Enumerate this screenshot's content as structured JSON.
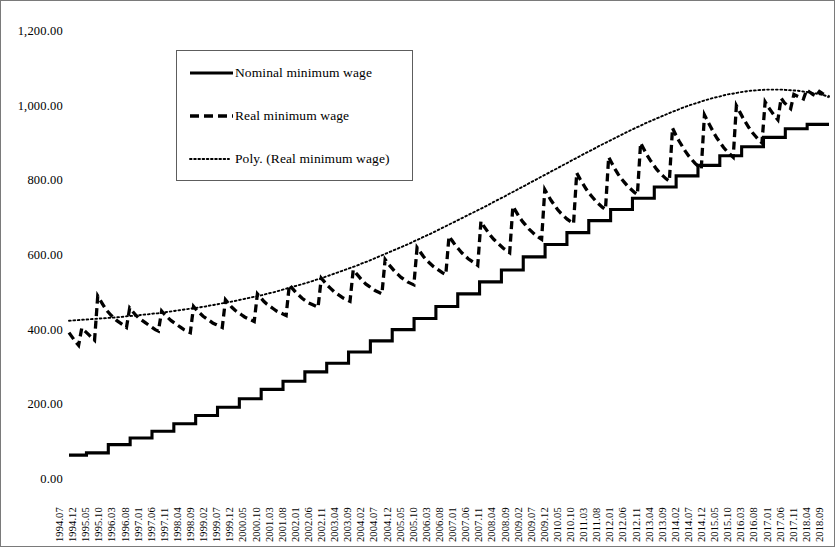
{
  "chart_data": {
    "type": "line",
    "title": "",
    "subtitle": "",
    "xlabel": "",
    "ylabel": "",
    "ylim": [
      0,
      1200
    ],
    "ytick_step": 200,
    "grid": false,
    "legend_position": "upper-left-inset",
    "y_ticks": [
      "0.00",
      "200.00",
      "400.00",
      "600.00",
      "800.00",
      "1,000.00",
      "1,200.00"
    ],
    "x_tick_labels": [
      "1994.07",
      "1994.12",
      "1995.05",
      "1995.10",
      "1996.03",
      "1996.08",
      "1997.01",
      "1997.06",
      "1997.11",
      "1998.04",
      "1998.09",
      "1999.02",
      "1999.07",
      "1999.12",
      "2000.05",
      "2000.10",
      "2001.03",
      "2001.08",
      "2002.01",
      "2002.06",
      "2002.11",
      "2003.04",
      "2003.09",
      "2004.02",
      "2004.07",
      "2004.12",
      "2005.05",
      "2005.10",
      "2006.03",
      "2006.08",
      "2007.01",
      "2007.06",
      "2007.11",
      "2008.04",
      "2008.09",
      "2009.02",
      "2009.07",
      "2009.12",
      "2010.05",
      "2010.10",
      "2011.03",
      "2011.08",
      "2012.01",
      "2012.06",
      "2012.11",
      "2013.04",
      "2013.09",
      "2014.02",
      "2014.07",
      "2014.12",
      "2015.05",
      "2015.10",
      "2016.03",
      "2016.08",
      "2017.01",
      "2017.06",
      "2017.11",
      "2018.04",
      "2018.09"
    ],
    "series": [
      {
        "name": "Nominal minimum wage",
        "style": "solid",
        "color": "#000000",
        "shape": "step",
        "values": [
          64,
          64,
          64,
          64,
          70,
          70,
          70,
          70,
          70,
          92,
          92,
          92,
          92,
          92,
          110,
          110,
          110,
          110,
          110,
          128,
          128,
          128,
          128,
          128,
          148,
          148,
          148,
          148,
          148,
          170,
          170,
          170,
          170,
          170,
          192,
          192,
          192,
          192,
          192,
          215,
          215,
          215,
          215,
          215,
          240,
          240,
          240,
          240,
          240,
          262,
          262,
          262,
          262,
          262,
          287,
          287,
          287,
          287,
          287,
          310,
          310,
          310,
          310,
          310,
          340,
          340,
          340,
          340,
          340,
          370,
          370,
          370,
          370,
          370,
          400,
          400,
          400,
          400,
          400,
          430,
          430,
          430,
          430,
          430,
          462,
          462,
          462,
          462,
          462,
          496,
          496,
          496,
          496,
          496,
          528,
          528,
          528,
          528,
          528,
          560,
          560,
          560,
          560,
          560,
          595,
          595,
          595,
          595,
          595,
          628,
          628,
          628,
          628,
          628,
          660,
          660,
          660,
          660,
          660,
          692,
          692,
          692,
          692,
          692,
          722,
          722,
          722,
          722,
          722,
          752,
          752,
          752,
          752,
          752,
          782,
          782,
          782,
          782,
          782,
          812,
          812,
          812,
          812,
          812,
          840,
          840,
          840,
          840,
          840,
          866,
          866,
          866,
          866,
          866,
          890,
          890,
          890,
          890,
          890,
          915,
          915,
          915,
          915,
          915,
          938,
          938,
          938,
          938,
          938,
          950,
          950,
          950,
          950,
          950,
          950
        ]
      },
      {
        "name": "Real minimum wage",
        "style": "dashed",
        "color": "#000000",
        "shape": "sawtooth",
        "values": [
          392,
          380,
          368,
          358,
          404,
          396,
          388,
          380,
          372,
          490,
          476,
          462,
          450,
          440,
          432,
          424,
          418,
          412,
          406,
          458,
          448,
          438,
          430,
          424,
          418,
          412,
          406,
          400,
          396,
          450,
          440,
          432,
          424,
          418,
          412,
          406,
          400,
          396,
          392,
          462,
          452,
          444,
          436,
          430,
          424,
          418,
          414,
          410,
          406,
          480,
          470,
          460,
          452,
          446,
          440,
          434,
          430,
          426,
          422,
          496,
          486,
          476,
          468,
          462,
          456,
          450,
          446,
          442,
          438,
          520,
          510,
          500,
          492,
          484,
          478,
          472,
          468,
          464,
          460,
          538,
          528,
          518,
          510,
          502,
          496,
          490,
          484,
          480,
          476,
          560,
          550,
          540,
          530,
          522,
          516,
          510,
          504,
          500,
          496,
          588,
          576,
          566,
          556,
          548,
          540,
          534,
          528,
          524,
          520,
          620,
          608,
          596,
          586,
          578,
          570,
          564,
          558,
          552,
          548,
          650,
          638,
          626,
          616,
          606,
          598,
          590,
          584,
          578,
          572,
          690,
          676,
          664,
          652,
          642,
          634,
          626,
          618,
          612,
          606,
          730,
          716,
          702,
          690,
          680,
          670,
          662,
          654,
          648,
          642,
          775,
          760,
          746,
          734,
          722,
          712,
          704,
          696,
          690,
          684,
          820,
          804,
          790,
          776,
          764,
          754,
          744,
          736,
          728,
          722,
          862,
          846,
          830,
          816,
          804,
          794,
          784,
          776,
          768,
          762,
          900,
          884,
          868,
          854,
          842,
          830,
          820,
          812,
          804,
          798,
          940,
          922,
          906,
          892,
          878,
          866,
          856,
          846,
          838,
          832,
          975,
          958,
          942,
          926,
          912,
          900,
          888,
          878,
          870,
          862,
          1000,
          984,
          968,
          954,
          940,
          928,
          918,
          908,
          900,
          1010,
          996,
          984,
          972,
          962,
          1020,
          1008,
          1000,
          992,
          1030,
          1026,
          1022,
          1018,
          1042,
          1036,
          1030,
          1026,
          1038,
          1032,
          1028,
          1024
        ]
      },
      {
        "name": "Poly. (Real minimum wage)",
        "style": "dotted",
        "color": "#000000",
        "shape": "polynomial-trend",
        "description": "Polynomial trendline fitted to real minimum wage",
        "values": [
          424,
          425,
          426,
          427,
          428,
          429,
          430,
          431,
          432,
          433,
          434,
          436,
          437,
          438,
          440,
          441,
          443,
          444,
          446,
          448,
          450,
          452,
          454,
          456,
          458,
          460,
          462,
          465,
          467,
          470,
          472,
          475,
          478,
          481,
          484,
          487,
          490,
          493,
          497,
          500,
          504,
          508,
          512,
          516,
          520,
          524,
          528,
          533,
          537,
          542,
          547,
          552,
          557,
          562,
          567,
          572,
          578,
          583,
          589,
          595,
          601,
          607,
          613,
          619,
          625,
          631,
          638,
          644,
          651,
          657,
          664,
          671,
          678,
          685,
          692,
          699,
          706,
          713,
          720,
          727,
          734,
          742,
          749,
          756,
          764,
          771,
          779,
          786,
          794,
          801,
          809,
          816,
          824,
          831,
          839,
          846,
          854,
          861,
          869,
          876,
          883,
          891,
          898,
          905,
          912,
          919,
          926,
          933,
          940,
          946,
          953,
          959,
          965,
          971,
          977,
          983,
          988,
          994,
          999,
          1004,
          1008,
          1013,
          1017,
          1021,
          1024,
          1028,
          1031,
          1033,
          1036,
          1038,
          1040,
          1041,
          1042,
          1043,
          1043,
          1043,
          1043,
          1042,
          1041,
          1040,
          1038,
          1036,
          1034,
          1031,
          1028,
          1024
        ]
      }
    ]
  },
  "legend": {
    "items": [
      {
        "label": "Nominal minimum wage",
        "style": "solid"
      },
      {
        "label": "Real minimum wage",
        "style": "dashed"
      },
      {
        "label": "Poly. (Real minimum wage)",
        "style": "dotted"
      }
    ]
  }
}
